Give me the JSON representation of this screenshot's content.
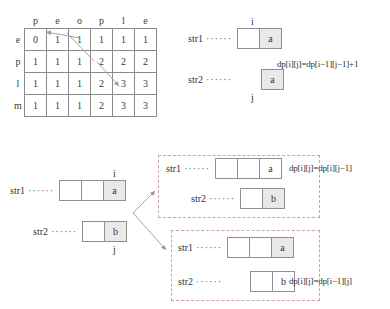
{
  "diagram_title": "Edit distance / LCS dynamic programming illustration",
  "dp_table": {
    "name": "dp-table",
    "col_headers": [
      "p",
      "e",
      "o",
      "p",
      "l",
      "e"
    ],
    "row_headers": [
      "e",
      "p",
      "l",
      "m"
    ],
    "rows": [
      [
        "0",
        "1",
        "1",
        "1",
        "1",
        "1"
      ],
      [
        "1",
        "1",
        "1",
        "2",
        "2",
        "2"
      ],
      [
        "1",
        "1",
        "1",
        "2",
        "3",
        "3"
      ],
      [
        "1",
        "1",
        "1",
        "2",
        "3",
        "3"
      ]
    ]
  },
  "case_match": {
    "str1_label": "str1",
    "str2_label": "str2",
    "dots": "······",
    "str1_cells": [
      "",
      "a"
    ],
    "str2_cells": [
      "a"
    ],
    "index_i": "i",
    "index_j": "j",
    "formula": "dp[i][j]=dp[i−1][j−1]+1"
  },
  "case_mismatch_source": {
    "str1_label": "str1",
    "str2_label": "str2",
    "dots": "······",
    "str1_cells": [
      "",
      "",
      "a"
    ],
    "str2_cells": [
      "",
      "b"
    ],
    "index_i": "i",
    "index_j": "j"
  },
  "case_drop_j": {
    "str1_label": "str1",
    "str2_label": "str2",
    "dots": "······",
    "str1_cells": [
      "",
      "",
      "a"
    ],
    "str2_cells": [
      "",
      "b"
    ],
    "formula": "dp[i][j]=dp[i][j−1]"
  },
  "case_drop_i": {
    "str1_label": "str1",
    "str2_label": "str2",
    "dots": "······",
    "str1_cells": [
      "",
      "",
      "a"
    ],
    "str2_cells": [
      "",
      "b"
    ],
    "formula": "dp[i][j]=dp[i−1][j]"
  },
  "colors": {
    "cell_border": "#8a8a8a",
    "cell_shade": "#e9e9e9",
    "dashed_border": "#c9a6a6",
    "arrow": "#9a9a9a",
    "text": "#2b2b2b"
  }
}
